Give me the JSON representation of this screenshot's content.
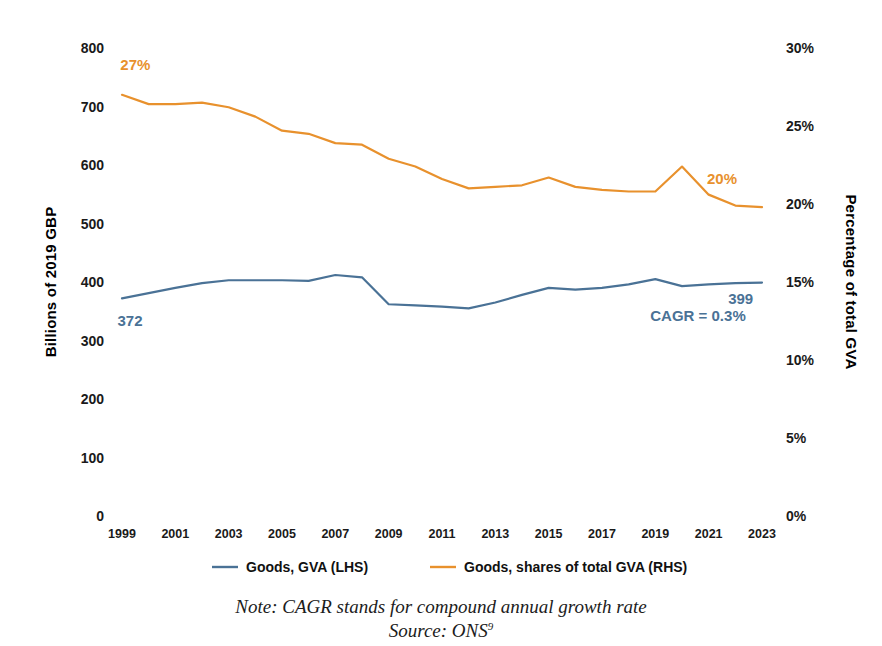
{
  "chart_data": {
    "type": "line",
    "title": "",
    "xlabel": "",
    "x": [
      1999,
      2000,
      2001,
      2002,
      2003,
      2004,
      2005,
      2006,
      2007,
      2008,
      2009,
      2010,
      2011,
      2012,
      2013,
      2014,
      2015,
      2016,
      2017,
      2018,
      2019,
      2020,
      2021,
      2022,
      2023
    ],
    "xtick_labels": [
      "1999",
      "2001",
      "2003",
      "2005",
      "2007",
      "2009",
      "2011",
      "2013",
      "2015",
      "2017",
      "2019",
      "2021",
      "2023"
    ],
    "xtick_values": [
      1999,
      2001,
      2003,
      2005,
      2007,
      2009,
      2011,
      2013,
      2015,
      2017,
      2019,
      2021,
      2023
    ],
    "xlim": [
      1999,
      2023
    ],
    "grid": false,
    "legend_position": "bottom",
    "left_axis": {
      "label": "Billions of 2019 GBP",
      "ylim": [
        0,
        800
      ],
      "ticks": [
        0,
        100,
        200,
        300,
        400,
        500,
        600,
        700,
        800
      ],
      "tick_labels": [
        "0",
        "100",
        "200",
        "300",
        "400",
        "500",
        "600",
        "700",
        "800"
      ]
    },
    "right_axis": {
      "label": "Percentage of total GVA",
      "ylim": [
        0,
        30
      ],
      "ticks": [
        0,
        5,
        10,
        15,
        20,
        25,
        30
      ],
      "tick_labels": [
        "0%",
        "5%",
        "10%",
        "15%",
        "20%",
        "25%",
        "30%"
      ]
    },
    "series": [
      {
        "name": "Goods, GVA (LHS)",
        "axis": "left",
        "color": "#4A7296",
        "values": [
          372,
          381,
          390,
          398,
          403,
          403,
          403,
          402,
          412,
          408,
          362,
          360,
          358,
          355,
          365,
          378,
          390,
          387,
          390,
          396,
          405,
          393,
          396,
          398,
          399
        ]
      },
      {
        "name": "Goods, shares of total GVA (RHS)",
        "axis": "right",
        "color": "#E8912D",
        "values": [
          27.0,
          26.4,
          26.4,
          26.5,
          26.2,
          25.6,
          24.7,
          24.5,
          23.9,
          23.8,
          22.9,
          22.4,
          21.6,
          21.0,
          21.1,
          21.2,
          21.7,
          21.1,
          20.9,
          20.8,
          20.8,
          22.4,
          20.6,
          19.9,
          19.8
        ]
      }
    ],
    "annotations": [
      {
        "text": "27%",
        "color": "#E8912D",
        "x": 1999.5,
        "y_axis": "right",
        "y_value": 28.6
      },
      {
        "text": "20%",
        "color": "#E8912D",
        "x": 2021.5,
        "y_axis": "right",
        "y_value": 21.3
      },
      {
        "text": "372",
        "color": "#4A7296",
        "x": 1999.3,
        "y_axis": "left",
        "y_value": 325
      },
      {
        "text": "399",
        "color": "#4A7296",
        "x": 2022.2,
        "y_axis": "left",
        "y_value": 363
      },
      {
        "text": "CAGR = 0.3%",
        "color": "#4A7296",
        "x": 2020.6,
        "y_axis": "left",
        "y_value": 333
      }
    ]
  },
  "legend": {
    "items": [
      {
        "label": "Goods, GVA (LHS)",
        "color": "#4A7296"
      },
      {
        "label": "Goods, shares of total GVA (RHS)",
        "color": "#E8912D"
      }
    ]
  },
  "footnotes": {
    "note": "Note: CAGR stands for compound annual growth rate",
    "source": "Source: ONS",
    "source_marker": "9"
  }
}
